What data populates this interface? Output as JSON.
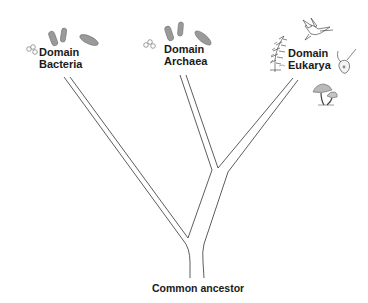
{
  "diagram": {
    "type": "phylogenetic-tree",
    "root_label": "Common ancestor",
    "domains": [
      {
        "id": "bacteria",
        "line1": "Domain",
        "line2": "Bacteria",
        "organisms": [
          "cocci-cluster",
          "rod-bacteria",
          "oval-bacterium"
        ]
      },
      {
        "id": "archaea",
        "line1": "Domain",
        "line2": "Archaea",
        "organisms": [
          "cocci-cluster",
          "rod-archaea",
          "oval-archaeon"
        ]
      },
      {
        "id": "eukarya",
        "line1": "Domain",
        "line2": "Eukarya",
        "organisms": [
          "fern-plant",
          "hummingbird",
          "protist-cell",
          "mushrooms"
        ]
      }
    ],
    "colors": {
      "line": "#333333",
      "microbe_fill": "#9a9a9a",
      "text": "#1a1a1a",
      "background": "#ffffff"
    }
  }
}
